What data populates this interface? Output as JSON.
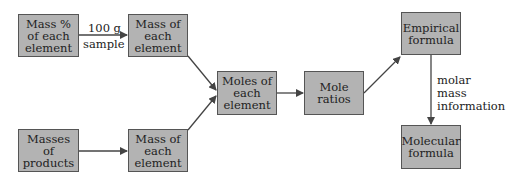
{
  "diagram": {
    "type": "flowchart",
    "colors": {
      "box_fill": "#b3b3b3",
      "box_border": "#555555",
      "arrow": "#444444",
      "text": "#222222"
    },
    "nodes": [
      {
        "id": "mass-percent",
        "label": "Mass % of each element"
      },
      {
        "id": "mass-element-top",
        "label": "Mass of each element"
      },
      {
        "id": "masses-products",
        "label": "Masses of products"
      },
      {
        "id": "mass-element-bottom",
        "label": "Mass of each element"
      },
      {
        "id": "moles-element",
        "label": "Moles of each element"
      },
      {
        "id": "mole-ratios",
        "label": "Mole ratios"
      },
      {
        "id": "empirical-formula",
        "label": "Empirical formula"
      },
      {
        "id": "molecular-formula",
        "label": "Molecular formula"
      }
    ],
    "edges": [
      {
        "from": "mass-percent",
        "to": "mass-element-top",
        "label": "100 g sample"
      },
      {
        "from": "masses-products",
        "to": "mass-element-bottom",
        "label": ""
      },
      {
        "from": "mass-element-top",
        "to": "moles-element",
        "label": ""
      },
      {
        "from": "mass-element-bottom",
        "to": "moles-element",
        "label": ""
      },
      {
        "from": "moles-element",
        "to": "mole-ratios",
        "label": ""
      },
      {
        "from": "mole-ratios",
        "to": "empirical-formula",
        "label": ""
      },
      {
        "from": "empirical-formula",
        "to": "molecular-formula",
        "label": "molar mass information"
      }
    ],
    "edge_labels": {
      "sample_line1": "100 g",
      "sample_line2": "sample",
      "molar_line1": "molar",
      "molar_line2": "mass",
      "molar_line3": "information"
    }
  }
}
